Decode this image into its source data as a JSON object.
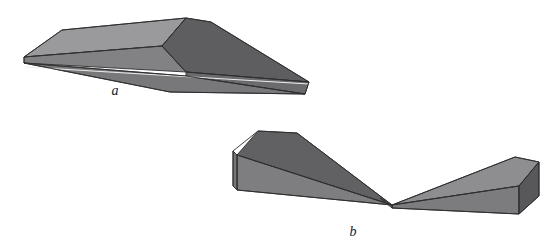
{
  "figure": {
    "background_color": "#ffffff",
    "width": 549,
    "height": 246,
    "caption_font_style": "italic"
  },
  "palette": {
    "outline": "#2e2e30",
    "highlight_line": "#ededea",
    "face_light": "#9a9a9c",
    "face_light_alt": "#8e8e90",
    "face_medium": "#808082",
    "face_medium_alt": "#787879",
    "face_dark": "#6a6a6c",
    "face_darker": "#5e5e60",
    "face_darkest": "#565658",
    "label_color": "#1a1a1a"
  },
  "solids": [
    {
      "id": "solid-a",
      "label": "a",
      "label_x": 115,
      "label_y": 95,
      "description": "Elongated triangular wedge prism pointed toward the left, ridge apex near upper middle",
      "faces": [
        {
          "name": "top-left-slope",
          "shade": "face_light",
          "color": "#9a9a9c",
          "points": "24,57 62,30 186,18 162,46"
        },
        {
          "name": "upper-ridge-panel",
          "shade": "face_medium",
          "color": "#828284",
          "points": "24,57 162,46 186,72 24,63"
        },
        {
          "name": "right-dark-slope",
          "shade": "face_darker",
          "color": "#5e5e60",
          "points": "186,18 211,22 309,82 186,72 162,46"
        },
        {
          "name": "right-lower-slope",
          "shade": "face_dark",
          "color": "#6b6b6d",
          "points": "186,72 309,82 305,94 186,76"
        },
        {
          "name": "under-wedge",
          "shade": "face_medium_alt",
          "color": "#78787a",
          "points": "24,63 186,76 305,94 170,92"
        }
      ],
      "edges": [
        "24,57 62,30",
        "62,30 186,18",
        "186,18 162,46",
        "162,46 24,57",
        "24,57 24,63",
        "162,46 186,72",
        "186,18 211,22",
        "211,22 309,82",
        "309,82 305,94",
        "186,72 309,82",
        "24,63 186,76",
        "186,76 305,94",
        "24,63 170,92",
        "170,92 305,94"
      ],
      "hairlines": [
        "26,67 309,84"
      ]
    },
    {
      "id": "solid-b",
      "label": "b",
      "label_x": 353,
      "label_y": 236,
      "description": "Two rectangular wedge blocks joined at a central low vertex, forming a shallow V",
      "faces": [
        {
          "name": "left-block-top",
          "shade": "face_darker",
          "color": "#616163",
          "points": "237,155 258,131 297,133 392,205"
        },
        {
          "name": "left-block-front",
          "shade": "face_medium",
          "color": "#7e7e80",
          "points": "237,155 392,205 237,190"
        },
        {
          "name": "left-block-end",
          "shade": "face_medium_alt",
          "color": "#787879",
          "points": "237,155 237,190 233,186 233,151"
        },
        {
          "name": "right-block-top",
          "shade": "face_light_alt",
          "color": "#8e8e90",
          "points": "392,205 515,157 539,162 519,186"
        },
        {
          "name": "right-block-front",
          "shade": "face_medium",
          "color": "#7c7c7e",
          "points": "392,205 519,186 519,214 392,208"
        },
        {
          "name": "right-block-end",
          "shade": "face_darkest",
          "color": "#58585a",
          "points": "519,186 539,162 539,196 519,214"
        },
        {
          "name": "joint-dark-sliver",
          "shade": "face_dark",
          "color": "#6d6d6f",
          "points": "380,198 392,205 392,208"
        }
      ],
      "edges": [
        "233,151 258,131",
        "258,131 297,133",
        "297,133 392,205",
        "237,155 392,205",
        "233,151 237,155",
        "233,151 233,186",
        "233,186 237,190",
        "237,155 237,190",
        "237,190 392,205",
        "392,205 515,157",
        "515,157 539,162",
        "539,162 519,186",
        "519,186 392,205",
        "519,186 519,214",
        "519,214 539,196",
        "539,162 539,196",
        "392,208 519,214",
        "392,205 392,208"
      ],
      "hairlines": []
    }
  ]
}
